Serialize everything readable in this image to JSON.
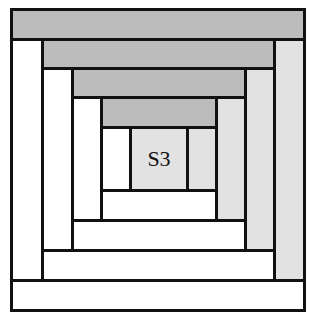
{
  "diagram": {
    "type": "log-cabin-quilt-block",
    "center_label": "S3",
    "colors": {
      "outline": "#111111",
      "dark_strip": "#bcbcbc",
      "light_strip": "#e2e2e2",
      "white_strip": "#ffffff"
    },
    "rings": 4
  }
}
